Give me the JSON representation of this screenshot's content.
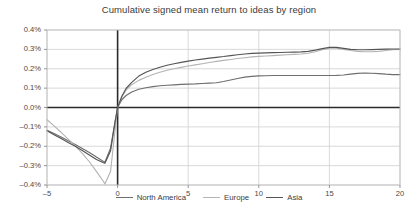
{
  "chart_data": {
    "type": "line",
    "title": "Cumulative signed mean return to ideas by region",
    "xlabel": "",
    "ylabel": "",
    "xlim": [
      -5,
      20
    ],
    "ylim": [
      -0.4,
      0.4
    ],
    "grid": true,
    "legend_position": "bottom",
    "y_tick_labels": [
      "0.4%",
      "0.3%",
      "0.2%",
      "0.1%",
      "0.0%",
      "–0.1%",
      "–0.2%",
      "–0.3%",
      "–0.4%"
    ],
    "y_tick_values": [
      0.4,
      0.3,
      0.2,
      0.1,
      0.0,
      -0.1,
      -0.2,
      -0.3,
      -0.4
    ],
    "x_tick_labels": [
      "–5",
      "0",
      "5",
      "10",
      "15",
      "20"
    ],
    "x_tick_values": [
      -5,
      0,
      5,
      10,
      15,
      20
    ],
    "x": [
      -5,
      -4.5,
      -4,
      -3.5,
      -3,
      -2.5,
      -2,
      -1.5,
      -1,
      -0.9,
      -0.5,
      -0.2,
      0,
      0.3,
      0.6,
      1,
      1.5,
      2,
      2.5,
      3,
      3.5,
      4,
      4.5,
      5,
      5.5,
      6,
      6.5,
      7,
      7.5,
      8,
      8.5,
      9,
      9.5,
      10,
      10.5,
      11,
      11.5,
      12,
      12.5,
      13,
      13.5,
      14,
      14.5,
      15,
      15.5,
      16,
      16.5,
      17,
      17.5,
      18,
      18.5,
      19,
      19.5,
      20
    ],
    "series": [
      {
        "name": "North America",
        "color": "#6e6e6e",
        "values": [
          -0.118,
          -0.134,
          -0.152,
          -0.172,
          -0.191,
          -0.211,
          -0.232,
          -0.256,
          -0.279,
          -0.282,
          -0.21,
          -0.08,
          0.0,
          0.04,
          0.062,
          0.08,
          0.094,
          0.102,
          0.108,
          0.112,
          0.115,
          0.117,
          0.119,
          0.121,
          0.122,
          0.124,
          0.126,
          0.128,
          0.134,
          0.142,
          0.15,
          0.157,
          0.161,
          0.163,
          0.164,
          0.165,
          0.165,
          0.165,
          0.165,
          0.165,
          0.165,
          0.165,
          0.165,
          0.165,
          0.166,
          0.168,
          0.172,
          0.176,
          0.178,
          0.177,
          0.175,
          0.172,
          0.17,
          0.17
        ]
      },
      {
        "name": "Europe",
        "color": "#b4b4b4",
        "values": [
          -0.063,
          -0.095,
          -0.128,
          -0.163,
          -0.198,
          -0.237,
          -0.28,
          -0.33,
          -0.382,
          -0.395,
          -0.33,
          -0.13,
          0.0,
          0.055,
          0.09,
          0.118,
          0.14,
          0.156,
          0.17,
          0.182,
          0.192,
          0.2,
          0.207,
          0.214,
          0.22,
          0.226,
          0.232,
          0.238,
          0.243,
          0.248,
          0.253,
          0.257,
          0.261,
          0.264,
          0.266,
          0.268,
          0.27,
          0.272,
          0.274,
          0.276,
          0.28,
          0.288,
          0.298,
          0.306,
          0.306,
          0.3,
          0.294,
          0.29,
          0.288,
          0.288,
          0.29,
          0.294,
          0.298,
          0.3
        ]
      },
      {
        "name": "Asia",
        "color": "#555555",
        "values": [
          -0.12,
          -0.14,
          -0.16,
          -0.18,
          -0.2,
          -0.222,
          -0.245,
          -0.268,
          -0.285,
          -0.288,
          -0.225,
          -0.085,
          0.0,
          0.058,
          0.098,
          0.13,
          0.162,
          0.182,
          0.196,
          0.208,
          0.218,
          0.226,
          0.233,
          0.239,
          0.245,
          0.25,
          0.255,
          0.259,
          0.263,
          0.268,
          0.272,
          0.276,
          0.279,
          0.281,
          0.282,
          0.283,
          0.284,
          0.285,
          0.286,
          0.287,
          0.29,
          0.296,
          0.304,
          0.31,
          0.31,
          0.305,
          0.3,
          0.298,
          0.298,
          0.299,
          0.3,
          0.301,
          0.302,
          0.302
        ]
      }
    ]
  }
}
